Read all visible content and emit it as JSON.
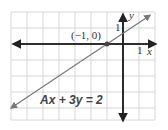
{
  "graph": {
    "x_axis_label": "x",
    "y_axis_label": "y",
    "x_unit_label": "1",
    "y_unit_label": "1",
    "point_label": "(−1, 0)",
    "equation_label": "Ax + 3y = 2",
    "point": {
      "x": -1,
      "y": 0
    },
    "line": {
      "slope": 0.6667,
      "intercept": 0.6667
    },
    "x_range": [
      -7,
      2
    ],
    "y_range": [
      -4.75,
      2
    ],
    "colors": {
      "grid": "#cccccc",
      "axis": "#222222",
      "line": "#777777",
      "point": "#444444"
    }
  }
}
